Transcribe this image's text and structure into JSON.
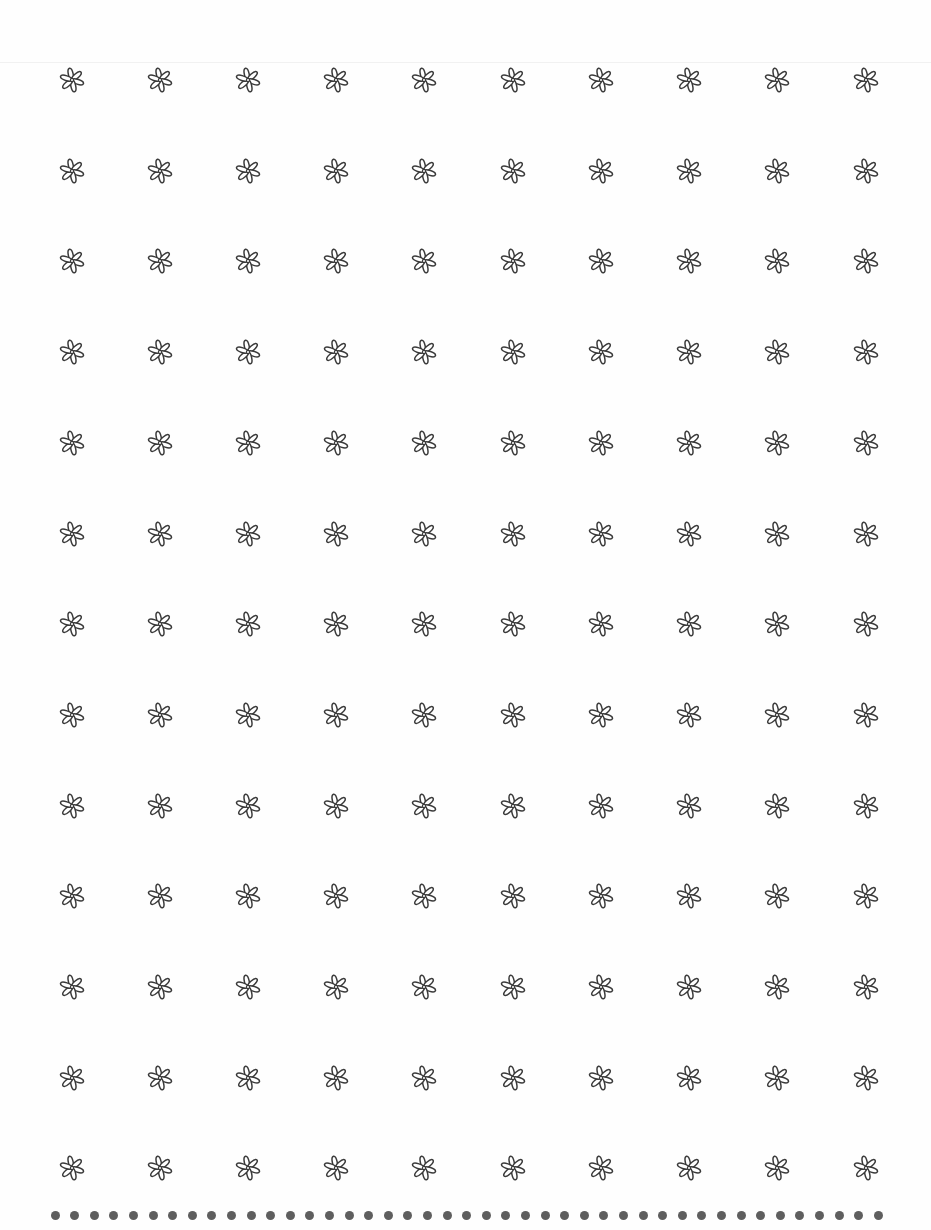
{
  "page": {
    "background": "#fefefe",
    "ink_color": "#3a3a3a"
  },
  "flower_grid": {
    "icon": "six-petal-flower-icon",
    "rows": 13,
    "columns": 10,
    "column_centers_x": [
      72,
      160,
      248,
      336,
      424,
      513,
      601,
      689,
      777,
      866
    ],
    "first_row_center_y": 80,
    "row_spacing": 90.7,
    "flower_size": 26
  },
  "dot_border": {
    "icon": "dot-icon",
    "count": 43,
    "first_x": 55,
    "spacing": 19.6,
    "color": "#5e5e5e"
  }
}
